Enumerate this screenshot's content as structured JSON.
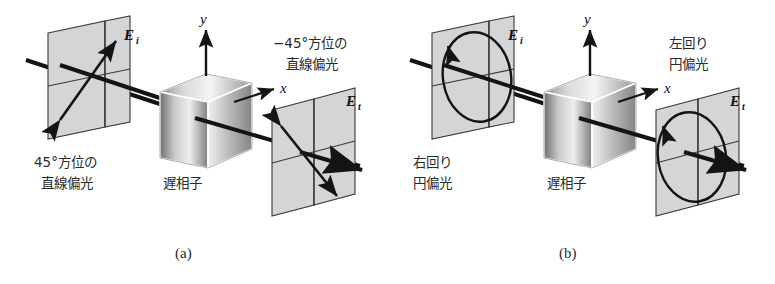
{
  "figure": {
    "title_glyphs": {
      "axis_y": "y",
      "axis_x": "x",
      "e_incident": "E",
      "e_incident_sub": "i",
      "e_transmitted": "E",
      "e_transmitted_sub": "t"
    },
    "panels": [
      {
        "id": "a",
        "caption": "(a)",
        "input_label_line1": "45°方位の",
        "input_label_line2": "直線偏光",
        "output_label_line1": "−45°方位の",
        "output_label_line2": "直線偏光",
        "device_label": "遅相子",
        "input_state": "linear-45",
        "output_state": "linear-minus45"
      },
      {
        "id": "b",
        "caption": "(b)",
        "input_label_line1": "右回り",
        "input_label_line2": "円偏光",
        "output_label_line1": "左回り",
        "output_label_line2": "円偏光",
        "device_label": "遅相子",
        "input_state": "circular-right",
        "output_state": "circular-left"
      }
    ],
    "colors": {
      "ink": "#1a1a1a",
      "plane_fill": "#d5d5d5",
      "plane_stroke": "#3a3a3a",
      "beam": "#141414",
      "cube_light": "#f2f2f2",
      "cube_dark": "#6e6e6e"
    }
  }
}
